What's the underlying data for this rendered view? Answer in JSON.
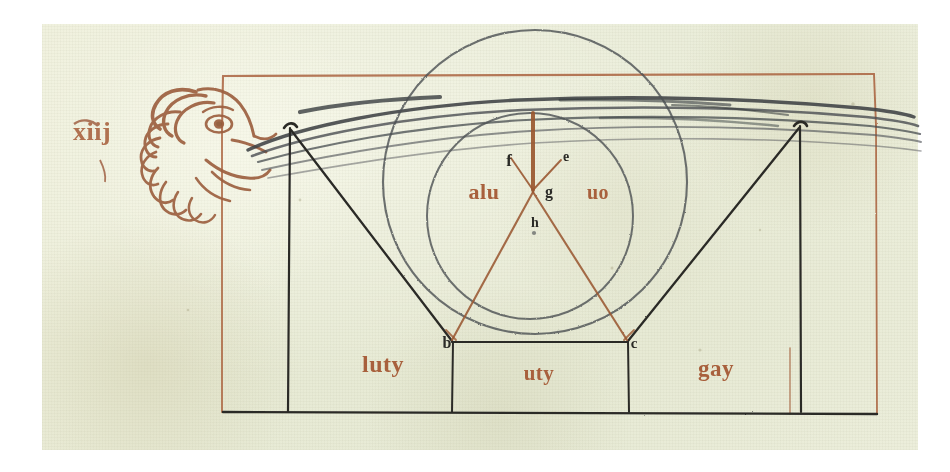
{
  "document": {
    "kind": "manuscript-diagram",
    "title": "Geometric diagram with wind-blowing head",
    "folio_mark": "xiij"
  },
  "colors": {
    "parchment": "#e9ecd8",
    "ink_black": "#2c2b28",
    "ink_brown": "#7a6a52",
    "rubric_red": "#a8603c",
    "plumb_red": "#9c5a34",
    "page_white": "#ffffff"
  },
  "margin": {
    "annotation": "xiij"
  },
  "figure": {
    "head": {
      "name": "wind-head",
      "description": "profile head of wind personification blowing"
    },
    "breath": {
      "name": "breath-streams",
      "count": 5
    },
    "frame": {
      "name": "red-rule-frame",
      "color": "#a8603c"
    }
  },
  "labels": {
    "apex_left": "f",
    "apex_right": "e",
    "center": "g",
    "below_center": "h",
    "left_word": "alu",
    "right_word": "uo",
    "base_left": "b",
    "base_right": "c",
    "bottom_left_word": "luty",
    "bottom_middle_word": "uty",
    "bottom_right_word": "gay"
  },
  "geometry": {
    "outer_circle": {
      "cx": 535,
      "cy": 182,
      "r": 152
    },
    "inner_circle": {
      "cx": 530,
      "cy": 216,
      "r": 103
    },
    "apex": {
      "x": 533,
      "y": 190
    },
    "base_left": {
      "x": 452,
      "y": 342
    },
    "base_right": {
      "x": 627,
      "y": 342
    },
    "left_post": {
      "x": 290,
      "y_top": 128,
      "y_bottom": 412
    },
    "right_post": {
      "x": 800,
      "y_top": 126,
      "y_bottom": 412
    },
    "baseline_y": 412,
    "frame_left_x": 222,
    "frame_right_x": 875,
    "frame_top_y": 74
  }
}
